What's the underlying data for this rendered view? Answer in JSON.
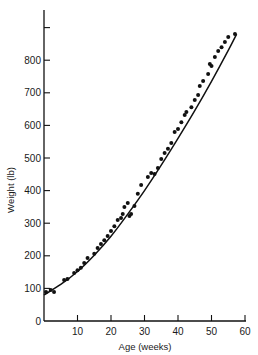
{
  "chart_data": {
    "type": "scatter",
    "title": "",
    "xlabel": "Age (weeks)",
    "ylabel": "Weight (lb)",
    "xlim": [
      0,
      60
    ],
    "ylim": [
      0,
      900
    ],
    "grid": false,
    "legend": null,
    "x_ticks": [
      10,
      20,
      30,
      40,
      50,
      60
    ],
    "x_tick_labels": [
      "10",
      "20",
      "30",
      "40",
      "50",
      "60"
    ],
    "y_ticks": [
      0,
      100,
      200,
      300,
      400,
      500,
      600,
      700,
      800,
      900
    ],
    "y_tick_labels": [
      "0",
      "100",
      "200",
      "300",
      "400",
      "500",
      "600",
      "700",
      "800",
      ""
    ],
    "series": [
      {
        "name": "observed weights",
        "kind": "scatter",
        "color": "#111111",
        "x": [
          0.6,
          2,
          3,
          6,
          7,
          9,
          10,
          11,
          12,
          13,
          15,
          16,
          17,
          18,
          19,
          20,
          21,
          22,
          23,
          23.5,
          24,
          25,
          25.5,
          26,
          27,
          28,
          29,
          31,
          32,
          33,
          34,
          35,
          36,
          37,
          38,
          39,
          40,
          41,
          42,
          42.5,
          44,
          45,
          46,
          46.5,
          47.5,
          49,
          49.5,
          50,
          51,
          52,
          53,
          54,
          55,
          57
        ],
        "y": [
          89,
          95,
          89,
          126,
          129,
          147,
          156,
          163,
          178,
          193,
          206,
          224,
          236,
          248,
          261,
          276,
          291,
          310,
          316,
          328,
          350,
          362,
          322,
          328,
          353,
          390,
          417,
          442,
          454,
          451,
          469,
          497,
          515,
          528,
          546,
          580,
          589,
          610,
          632,
          641,
          656,
          678,
          693,
          721,
          736,
          758,
          788,
          782,
          810,
          828,
          840,
          856,
          871,
          880
        ]
      },
      {
        "name": "fitted growth curve",
        "kind": "line",
        "color": "#111111",
        "x": [
          0,
          5,
          10,
          15,
          20,
          25,
          30,
          35,
          40,
          45,
          50,
          55,
          57.5
        ],
        "y": [
          80,
          112,
          152,
          202,
          260,
          328,
          400,
          478,
          560,
          645,
          735,
          830,
          880
        ]
      }
    ]
  }
}
